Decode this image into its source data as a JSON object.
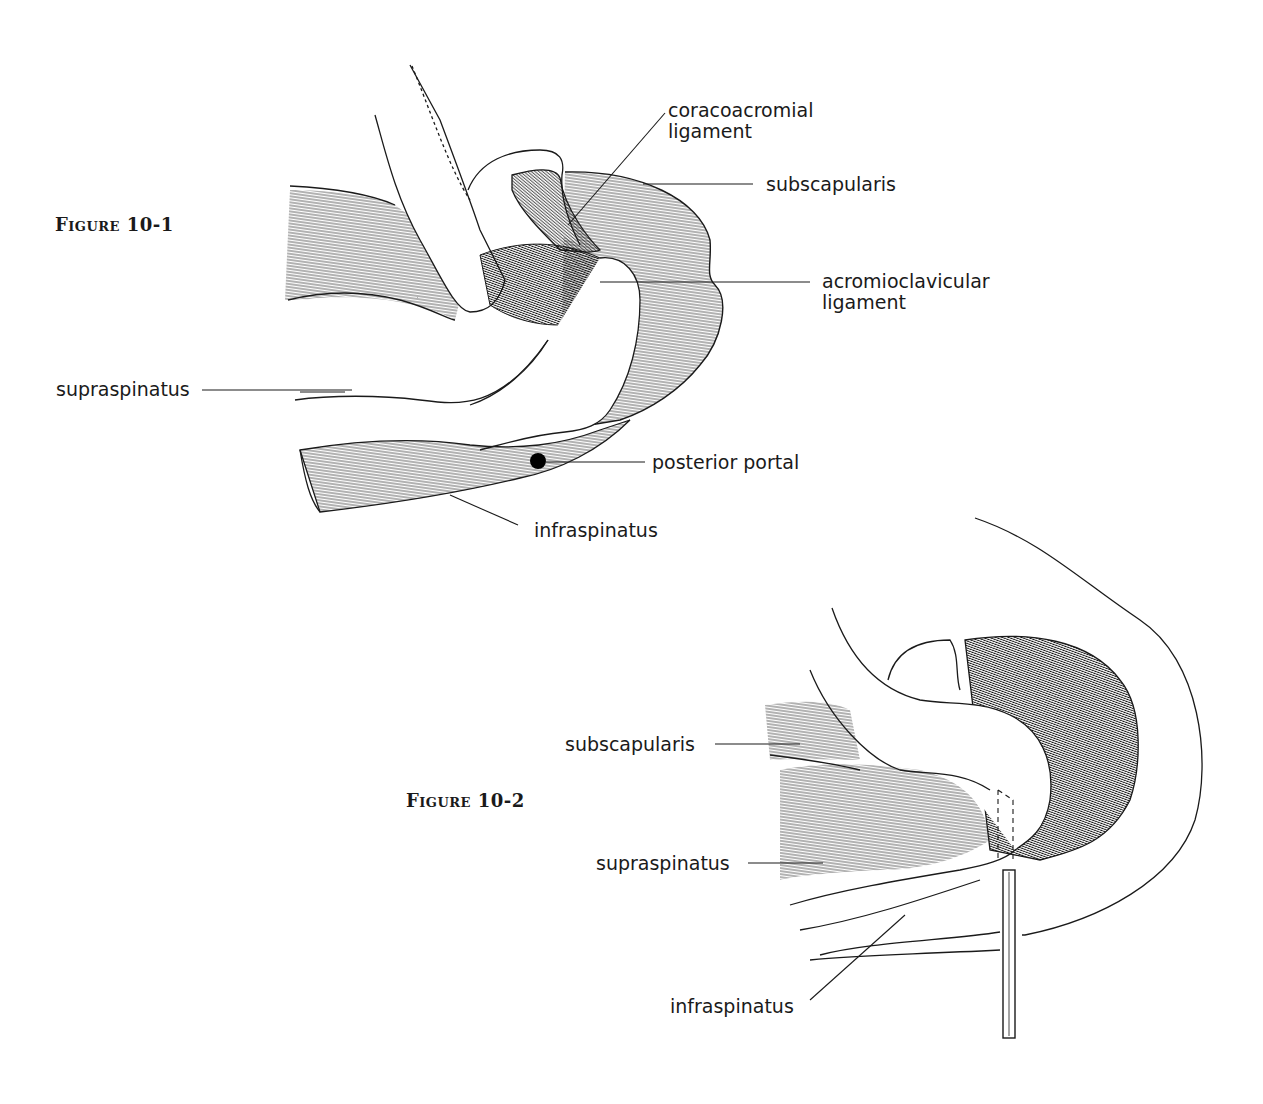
{
  "figures": [
    {
      "title": "Figure 10-1",
      "labels": {
        "coracoacromial_ligament": [
          "coracoacromial",
          "ligament"
        ],
        "subscapularis": "subscapularis",
        "acromioclavicular_ligament": [
          "acromioclavicular",
          "ligament"
        ],
        "supraspinatus": "supraspinatus",
        "posterior_portal": "posterior portal",
        "infraspinatus": "infraspinatus"
      }
    },
    {
      "title": "Figure 10-2",
      "labels": {
        "subscapularis": "subscapularis",
        "supraspinatus": "supraspinatus",
        "infraspinatus": "infraspinatus"
      }
    }
  ],
  "colors": {
    "ink": "#1a1a1a",
    "background": "#ffffff"
  }
}
